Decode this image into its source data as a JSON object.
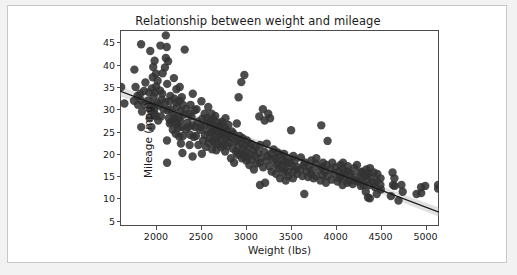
{
  "figure": {
    "background": "#ffffff",
    "page_background": "#f2f2f2",
    "frame_color": "#c8c8c8"
  },
  "chart_data": {
    "type": "scatter",
    "title": "Relationship between weight and mileage",
    "xlabel": "Weight (lbs)",
    "ylabel": "Mileage (mpg)",
    "xlim": [
      1600,
      5150
    ],
    "ylim": [
      3.8,
      47.8
    ],
    "xticks": [
      2000,
      2500,
      3000,
      3500,
      4000,
      4500,
      5000
    ],
    "xtick_labels": [
      "2000",
      "2500",
      "3000",
      "3500",
      "4000",
      "4500",
      "5000"
    ],
    "yticks": [
      5,
      10,
      15,
      20,
      25,
      30,
      35,
      40,
      45
    ],
    "ytick_labels": [
      "5",
      "10",
      "15",
      "20",
      "25",
      "30",
      "35",
      "40",
      "45"
    ],
    "grid": false,
    "legend": null,
    "marker_color": "#333333",
    "marker_size": 4.2,
    "marker_opacity": 0.88,
    "regression": {
      "show": true,
      "line_color": "#1a1a1a",
      "band_color": "#9a9a9a",
      "band_opacity": 0.3,
      "x_start": 1600,
      "y_start": 34.1,
      "x_end": 5150,
      "y_end": 6.9,
      "band_halfwidth_start": 1.15,
      "band_halfwidth_mid": 0.35,
      "band_halfwidth_end": 1.05
    },
    "points": [
      [
        1613,
        35.0
      ],
      [
        1649,
        31.3
      ],
      [
        1755,
        31.9
      ],
      [
        1760,
        38.9
      ],
      [
        1773,
        35.0
      ],
      [
        1795,
        33.0
      ],
      [
        1800,
        31.0
      ],
      [
        1825,
        33.5
      ],
      [
        1834,
        32.0
      ],
      [
        1835,
        44.6
      ],
      [
        1836,
        26.0
      ],
      [
        1845,
        29.5
      ],
      [
        1867,
        34.1
      ],
      [
        1875,
        31.0
      ],
      [
        1883,
        36.0
      ],
      [
        1915,
        32.0
      ],
      [
        1925,
        33.8
      ],
      [
        1930,
        28.0
      ],
      [
        1937,
        43.1
      ],
      [
        1940,
        29.8
      ],
      [
        1945,
        30.5
      ],
      [
        1950,
        26.0
      ],
      [
        1955,
        34.7
      ],
      [
        1965,
        37.2
      ],
      [
        1968,
        31.0
      ],
      [
        1970,
        39.5
      ],
      [
        1975,
        32.8
      ],
      [
        1980,
        30.0
      ],
      [
        1985,
        40.9
      ],
      [
        1985,
        29.0
      ],
      [
        1990,
        33.8
      ],
      [
        1995,
        28.5
      ],
      [
        2000,
        38.0
      ],
      [
        2003,
        35.1
      ],
      [
        2019,
        36.4
      ],
      [
        2020,
        31.5
      ],
      [
        2025,
        27.5
      ],
      [
        2035,
        30.9
      ],
      [
        2045,
        34.2
      ],
      [
        2050,
        44.3
      ],
      [
        2055,
        28.4
      ],
      [
        2065,
        32.2
      ],
      [
        2070,
        33.5
      ],
      [
        2075,
        38.1
      ],
      [
        2085,
        30.0
      ],
      [
        2100,
        39.4
      ],
      [
        2105,
        31.6
      ],
      [
        2110,
        41.5
      ],
      [
        2110,
        46.6
      ],
      [
        2120,
        44.0
      ],
      [
        2123,
        23.0
      ],
      [
        2124,
        18.0
      ],
      [
        2125,
        35.7
      ],
      [
        2130,
        29.8
      ],
      [
        2135,
        40.8
      ],
      [
        2144,
        28.0
      ],
      [
        2150,
        31.8
      ],
      [
        2155,
        26.8
      ],
      [
        2160,
        33.0
      ],
      [
        2164,
        30.0
      ],
      [
        2171,
        27.2
      ],
      [
        2188,
        25.4
      ],
      [
        2190,
        29.0
      ],
      [
        2200,
        37.0
      ],
      [
        2205,
        32.4
      ],
      [
        2210,
        28.1
      ],
      [
        2219,
        27.2
      ],
      [
        2220,
        24.5
      ],
      [
        2223,
        31.5
      ],
      [
        2228,
        34.5
      ],
      [
        2230,
        26.6
      ],
      [
        2234,
        30.5
      ],
      [
        2245,
        25.8
      ],
      [
        2254,
        28.0
      ],
      [
        2259,
        23.9
      ],
      [
        2264,
        31.9
      ],
      [
        2265,
        35.0
      ],
      [
        2270,
        27.4
      ],
      [
        2275,
        29.5
      ],
      [
        2278,
        22.3
      ],
      [
        2285,
        26.0
      ],
      [
        2288,
        32.7
      ],
      [
        2295,
        20.2
      ],
      [
        2300,
        31.0
      ],
      [
        2300,
        24.0
      ],
      [
        2310,
        28.8
      ],
      [
        2320,
        43.4
      ],
      [
        2330,
        25.5
      ],
      [
        2335,
        30.0
      ],
      [
        2350,
        27.0
      ],
      [
        2360,
        26.0
      ],
      [
        2370,
        29.0
      ],
      [
        2375,
        22.0
      ],
      [
        2380,
        24.3
      ],
      [
        2385,
        31.0
      ],
      [
        2395,
        28.4
      ],
      [
        2405,
        26.4
      ],
      [
        2408,
        19.4
      ],
      [
        2410,
        33.5
      ],
      [
        2420,
        23.8
      ],
      [
        2430,
        29.8
      ],
      [
        2434,
        26.0
      ],
      [
        2445,
        24.0
      ],
      [
        2451,
        30.0
      ],
      [
        2464,
        27.2
      ],
      [
        2472,
        22.0
      ],
      [
        2490,
        25.4
      ],
      [
        2500,
        26.0
      ],
      [
        2506,
        31.8
      ],
      [
        2511,
        20.0
      ],
      [
        2515,
        27.9
      ],
      [
        2525,
        23.0
      ],
      [
        2542,
        29.0
      ],
      [
        2545,
        24.2
      ],
      [
        2550,
        26.5
      ],
      [
        2556,
        21.5
      ],
      [
        2565,
        28.0
      ],
      [
        2575,
        25.0
      ],
      [
        2582,
        30.5
      ],
      [
        2587,
        22.5
      ],
      [
        2595,
        26.8
      ],
      [
        2600,
        23.5
      ],
      [
        2605,
        27.5
      ],
      [
        2615,
        24.8
      ],
      [
        2620,
        29.0
      ],
      [
        2625,
        21.0
      ],
      [
        2634,
        26.0
      ],
      [
        2635,
        23.0
      ],
      [
        2640,
        27.8
      ],
      [
        2648,
        25.2
      ],
      [
        2655,
        22.4
      ],
      [
        2660,
        28.5
      ],
      [
        2665,
        24.0
      ],
      [
        2670,
        26.2
      ],
      [
        2672,
        20.8
      ],
      [
        2678,
        25.0
      ],
      [
        2685,
        22.2
      ],
      [
        2690,
        27.0
      ],
      [
        2695,
        23.7
      ],
      [
        2700,
        25.5
      ],
      [
        2710,
        24.5
      ],
      [
        2720,
        26.5
      ],
      [
        2725,
        21.5
      ],
      [
        2730,
        23.0
      ],
      [
        2735,
        27.2
      ],
      [
        2740,
        25.0
      ],
      [
        2750,
        22.0
      ],
      [
        2755,
        24.5
      ],
      [
        2765,
        26.0
      ],
      [
        2770,
        20.5
      ],
      [
        2774,
        28.0
      ],
      [
        2780,
        23.5
      ],
      [
        2790,
        25.2
      ],
      [
        2795,
        21.8
      ],
      [
        2800,
        24.0
      ],
      [
        2807,
        26.5
      ],
      [
        2815,
        22.5
      ],
      [
        2830,
        23.8
      ],
      [
        2835,
        19.0
      ],
      [
        2845,
        25.0
      ],
      [
        2855,
        21.2
      ],
      [
        2865,
        24.5
      ],
      [
        2870,
        18.0
      ],
      [
        2875,
        22.8
      ],
      [
        2890,
        20.5
      ],
      [
        2900,
        26.8
      ],
      [
        2905,
        23.0
      ],
      [
        2910,
        19.8
      ],
      [
        2915,
        21.5
      ],
      [
        2920,
        32.7
      ],
      [
        2930,
        24.0
      ],
      [
        2933,
        20.0
      ],
      [
        2945,
        22.5
      ],
      [
        2950,
        36.1
      ],
      [
        2957,
        19.0
      ],
      [
        2965,
        23.5
      ],
      [
        2970,
        21.0
      ],
      [
        2979,
        19.4
      ],
      [
        2984,
        37.7
      ],
      [
        2990,
        22.0
      ],
      [
        3000,
        20.5
      ],
      [
        3005,
        18.5
      ],
      [
        3012,
        23.0
      ],
      [
        3021,
        19.2
      ],
      [
        3035,
        21.8
      ],
      [
        3039,
        17.5
      ],
      [
        3045,
        20.0
      ],
      [
        3060,
        22.2
      ],
      [
        3070,
        18.8
      ],
      [
        3085,
        20.8
      ],
      [
        3090,
        16.5
      ],
      [
        3102,
        19.5
      ],
      [
        3110,
        21.5
      ],
      [
        3121,
        17.8
      ],
      [
        3139,
        20.2
      ],
      [
        3150,
        28.4
      ],
      [
        3155,
        18.0
      ],
      [
        3158,
        13.0
      ],
      [
        3160,
        22.0
      ],
      [
        3169,
        19.0
      ],
      [
        3190,
        30.0
      ],
      [
        3193,
        17.0
      ],
      [
        3205,
        20.5
      ],
      [
        3210,
        27.5
      ],
      [
        3215,
        13.5
      ],
      [
        3230,
        18.5
      ],
      [
        3233,
        22.3
      ],
      [
        3245,
        19.5
      ],
      [
        3250,
        29.0
      ],
      [
        3265,
        17.2
      ],
      [
        3270,
        28.0
      ],
      [
        3278,
        20.0
      ],
      [
        3288,
        16.0
      ],
      [
        3302,
        18.8
      ],
      [
        3310,
        21.0
      ],
      [
        3329,
        19.0
      ],
      [
        3336,
        15.5
      ],
      [
        3345,
        17.5
      ],
      [
        3353,
        20.3
      ],
      [
        3360,
        18.0
      ],
      [
        3365,
        16.8
      ],
      [
        3380,
        19.8
      ],
      [
        3381,
        14.5
      ],
      [
        3399,
        17.0
      ],
      [
        3410,
        18.5
      ],
      [
        3420,
        15.8
      ],
      [
        3425,
        20.0
      ],
      [
        3433,
        16.5
      ],
      [
        3439,
        18.2
      ],
      [
        3445,
        14.0
      ],
      [
        3459,
        17.8
      ],
      [
        3465,
        19.0
      ],
      [
        3470,
        16.0
      ],
      [
        3475,
        15.0
      ],
      [
        3490,
        18.0
      ],
      [
        3504,
        25.3
      ],
      [
        3520,
        17.2
      ],
      [
        3525,
        14.5
      ],
      [
        3530,
        19.5
      ],
      [
        3535,
        16.2
      ],
      [
        3545,
        18.5
      ],
      [
        3570,
        15.5
      ],
      [
        3574,
        17.0
      ],
      [
        3605,
        16.5
      ],
      [
        3613,
        19.2
      ],
      [
        3630,
        15.0
      ],
      [
        3645,
        17.5
      ],
      [
        3651,
        11.0
      ],
      [
        3660,
        18.0
      ],
      [
        3672,
        16.0
      ],
      [
        3693,
        14.8
      ],
      [
        3700,
        17.0
      ],
      [
        3725,
        15.5
      ],
      [
        3730,
        18.5
      ],
      [
        3735,
        16.3
      ],
      [
        3755,
        14.5
      ],
      [
        3777,
        17.8
      ],
      [
        3781,
        15.0
      ],
      [
        3785,
        19.0
      ],
      [
        3820,
        16.5
      ],
      [
        3830,
        14.0
      ],
      [
        3840,
        26.4
      ],
      [
        3850,
        17.0
      ],
      [
        3855,
        15.2
      ],
      [
        3860,
        18.0
      ],
      [
        3880,
        16.0
      ],
      [
        3892,
        13.5
      ],
      [
        3900,
        17.5
      ],
      [
        3907,
        15.0
      ],
      [
        3910,
        22.9
      ],
      [
        3940,
        16.5
      ],
      [
        3955,
        14.2
      ],
      [
        3962,
        18.0
      ],
      [
        3988,
        15.5
      ],
      [
        4000,
        17.0
      ],
      [
        4020,
        13.8
      ],
      [
        4034,
        16.0
      ],
      [
        4042,
        14.5
      ],
      [
        4054,
        17.5
      ],
      [
        4060,
        15.0
      ],
      [
        4077,
        13.0
      ],
      [
        4080,
        16.5
      ],
      [
        4082,
        18.0
      ],
      [
        4096,
        14.8
      ],
      [
        4100,
        15.8
      ],
      [
        4129,
        13.5
      ],
      [
        4135,
        17.2
      ],
      [
        4141,
        16.0
      ],
      [
        4154,
        14.0
      ],
      [
        4165,
        15.5
      ],
      [
        4190,
        13.2
      ],
      [
        4209,
        16.8
      ],
      [
        4215,
        15.0
      ],
      [
        4220,
        14.0
      ],
      [
        4237,
        17.5
      ],
      [
        4257,
        13.8
      ],
      [
        4278,
        15.8
      ],
      [
        4280,
        12.8
      ],
      [
        4294,
        16.0
      ],
      [
        4295,
        14.5
      ],
      [
        4312,
        13.0
      ],
      [
        4325,
        15.0
      ],
      [
        4335,
        11.5
      ],
      [
        4341,
        16.5
      ],
      [
        4354,
        14.2
      ],
      [
        4360,
        10.2
      ],
      [
        4363,
        15.5
      ],
      [
        4376,
        13.0
      ],
      [
        4380,
        10.0
      ],
      [
        4382,
        16.8
      ],
      [
        4385,
        14.8
      ],
      [
        4422,
        13.5
      ],
      [
        4425,
        15.8
      ],
      [
        4440,
        12.5
      ],
      [
        4456,
        14.0
      ],
      [
        4457,
        11.0
      ],
      [
        4464,
        15.5
      ],
      [
        4498,
        13.0
      ],
      [
        4499,
        14.5
      ],
      [
        4502,
        12.0
      ],
      [
        4615,
        10.5
      ],
      [
        4633,
        15.8
      ],
      [
        4638,
        13.0
      ],
      [
        4654,
        14.5
      ],
      [
        4657,
        12.8
      ],
      [
        4699,
        9.5
      ],
      [
        4732,
        13.0
      ],
      [
        4746,
        11.5
      ],
      [
        4900,
        11.0
      ],
      [
        4951,
        12.5
      ],
      [
        4952,
        11.2
      ],
      [
        4997,
        12.8
      ],
      [
        5140,
        13.0
      ],
      [
        5140,
        12.2
      ]
    ]
  }
}
